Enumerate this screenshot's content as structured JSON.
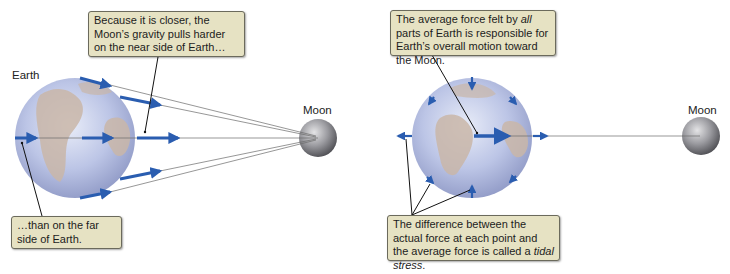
{
  "left_panel": {
    "earth_label": "Earth",
    "moon_label": "Moon",
    "callout_top": "Because it is closer, the Moon’s gravity pulls harder on the near side of Earth…",
    "callout_bottom": "…than on the far side of Earth."
  },
  "right_panel": {
    "moon_label": "Moon",
    "callout_top": {
      "part1": "The average force felt by ",
      "italic": "all",
      "part2": " parts of Earth is responsible for Earth’s overall motion toward the Moon."
    },
    "callout_bottom": {
      "part1": "The difference between the actual force at each point and the average force is called a ",
      "italic": "tidal stress",
      "part2": "."
    }
  },
  "colors": {
    "arrow": "#2a5db0",
    "callout_bg": "#e6e2c3",
    "callout_border": "#6b6a5c",
    "earth_ocean": "#b9c3e3",
    "earth_land": "#c9b6a8",
    "moon": "#8f8f93"
  }
}
